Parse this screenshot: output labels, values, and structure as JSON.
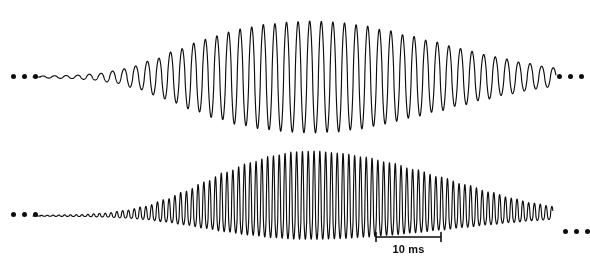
{
  "figure": {
    "background_color": "#ffffff",
    "trace_color": "#0d0d0d",
    "width": 590,
    "height": 270
  },
  "scalebar": {
    "label": "10 ms",
    "x_start": 376,
    "x_end": 441,
    "y": 237,
    "tick_height": 9,
    "length_px": 65,
    "value": 10,
    "unit": "ms"
  },
  "ellipses": {
    "dot_count": 3,
    "dot_diameter": 5,
    "positions": [
      {
        "name": "top-left-ellipsis",
        "x": 11,
        "y": 74
      },
      {
        "name": "top-right-ellipsis",
        "x": 557,
        "y": 74
      },
      {
        "name": "bottom-left-ellipsis",
        "x": 11,
        "y": 212
      },
      {
        "name": "bottom-right-ellipsis",
        "x": 563,
        "y": 229
      }
    ]
  },
  "chart_data": {
    "type": "line",
    "xlabel": "Time",
    "ylabel": "Amplitude",
    "xlim": [
      0,
      590
    ],
    "grid": false,
    "legend": "none",
    "annotations": [
      {
        "text": "10 ms",
        "type": "scalebar",
        "x": 408,
        "y": 243
      }
    ],
    "series": [
      {
        "name": "upper-waveform",
        "baseline_y": 77,
        "x_start": 40,
        "x_end": 556,
        "carrier_period_px": 11.6,
        "peak_amplitude_px": 56,
        "envelope_peak_x": 308,
        "envelope_start_amplitude_px": 1.5,
        "envelope_end_amplitude_px": 10,
        "asymmetry": 0.0,
        "envelope_points": [
          {
            "x": 40,
            "a": 1.0
          },
          {
            "x": 70,
            "a": 1.5
          },
          {
            "x": 95,
            "a": 3.0
          },
          {
            "x": 115,
            "a": 6.0
          },
          {
            "x": 135,
            "a": 11.0
          },
          {
            "x": 155,
            "a": 18.0
          },
          {
            "x": 175,
            "a": 26.0
          },
          {
            "x": 195,
            "a": 34.0
          },
          {
            "x": 215,
            "a": 41.0
          },
          {
            "x": 240,
            "a": 48.0
          },
          {
            "x": 265,
            "a": 52.5
          },
          {
            "x": 290,
            "a": 55.0
          },
          {
            "x": 310,
            "a": 56.0
          },
          {
            "x": 335,
            "a": 55.0
          },
          {
            "x": 360,
            "a": 52.0
          },
          {
            "x": 385,
            "a": 47.0
          },
          {
            "x": 410,
            "a": 41.0
          },
          {
            "x": 435,
            "a": 35.0
          },
          {
            "x": 460,
            "a": 28.5
          },
          {
            "x": 485,
            "a": 22.5
          },
          {
            "x": 505,
            "a": 18.0
          },
          {
            "x": 525,
            "a": 14.0
          },
          {
            "x": 545,
            "a": 10.5
          },
          {
            "x": 556,
            "a": 9.0
          }
        ]
      },
      {
        "name": "lower-waveform",
        "baseline_y": 216,
        "x_start": 40,
        "x_end": 553,
        "carrier_period_px": 5.8,
        "peak_amplitude_px": 48,
        "envelope_peak_x": 300,
        "envelope_start_amplitude_px": 0.8,
        "envelope_end_amplitude_px": 7,
        "asymmetry": 0.82,
        "envelope_points": [
          {
            "x": 40,
            "a": 0.5
          },
          {
            "x": 80,
            "a": 1.0
          },
          {
            "x": 105,
            "a": 2.0
          },
          {
            "x": 125,
            "a": 4.0
          },
          {
            "x": 145,
            "a": 7.0
          },
          {
            "x": 165,
            "a": 12.0
          },
          {
            "x": 185,
            "a": 18.0
          },
          {
            "x": 205,
            "a": 25.0
          },
          {
            "x": 225,
            "a": 32.0
          },
          {
            "x": 250,
            "a": 39.0
          },
          {
            "x": 272,
            "a": 44.0
          },
          {
            "x": 295,
            "a": 47.0
          },
          {
            "x": 315,
            "a": 47.5
          },
          {
            "x": 340,
            "a": 46.0
          },
          {
            "x": 365,
            "a": 43.0
          },
          {
            "x": 390,
            "a": 39.0
          },
          {
            "x": 415,
            "a": 34.0
          },
          {
            "x": 440,
            "a": 28.5
          },
          {
            "x": 465,
            "a": 23.0
          },
          {
            "x": 490,
            "a": 17.5
          },
          {
            "x": 512,
            "a": 13.0
          },
          {
            "x": 532,
            "a": 9.5
          },
          {
            "x": 553,
            "a": 7.0
          }
        ]
      }
    ]
  }
}
